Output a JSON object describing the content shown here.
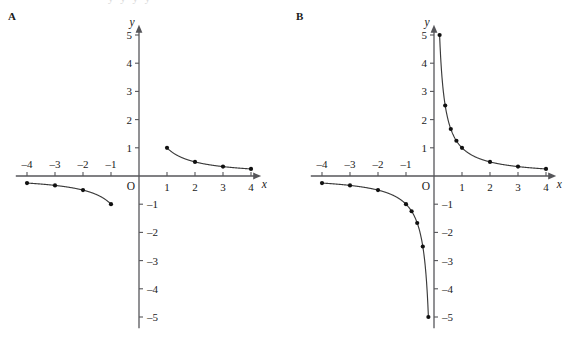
{
  "figure": {
    "cut_off_header_text": "y y y y",
    "panels": [
      {
        "key": "A",
        "label": "A",
        "name": "panel-a",
        "origin_label": "O",
        "x_axis_label": "x",
        "y_axis_label": "y",
        "x_ticks": [
          -4,
          -3,
          -2,
          -1,
          1,
          2,
          3,
          4
        ],
        "x_tick_labels": [
          "–4",
          "–3",
          "–2",
          "–1",
          "1",
          "2",
          "3",
          "4"
        ],
        "y_ticks": [
          5,
          4,
          3,
          2,
          1,
          -1,
          -2,
          -3,
          -4,
          -5
        ],
        "y_tick_labels": [
          "5",
          "4",
          "3",
          "2",
          "1",
          "–1",
          "–2",
          "–3",
          "–4",
          "–5"
        ],
        "xlim": [
          -4.4,
          4.4
        ],
        "ylim": [
          -5.4,
          5.4
        ],
        "points": [
          {
            "x": 1,
            "y": 1
          },
          {
            "x": 2,
            "y": 0.5
          },
          {
            "x": 3,
            "y": 0.3333
          },
          {
            "x": 4,
            "y": 0.25
          },
          {
            "x": -1,
            "y": -1
          },
          {
            "x": -2,
            "y": -0.5
          },
          {
            "x": -3,
            "y": -0.3333
          },
          {
            "x": -4,
            "y": -0.25
          }
        ],
        "curves": [
          {
            "branch": "positive",
            "x_from": 1,
            "x_to": 4
          },
          {
            "branch": "negative",
            "x_from": -4,
            "x_to": -1
          }
        ]
      },
      {
        "key": "B",
        "label": "B",
        "name": "panel-b",
        "origin_label": "O",
        "x_axis_label": "x",
        "y_axis_label": "y",
        "x_ticks": [
          -4,
          -3,
          -2,
          -1,
          1,
          2,
          3,
          4
        ],
        "x_tick_labels": [
          "–4",
          "–3",
          "–2",
          "–1",
          "1",
          "2",
          "3",
          "4"
        ],
        "y_ticks": [
          5,
          4,
          3,
          2,
          1,
          -1,
          -2,
          -3,
          -4,
          -5
        ],
        "y_tick_labels": [
          "5",
          "4",
          "3",
          "2",
          "1",
          "–1",
          "–2",
          "–3",
          "–4",
          "–5"
        ],
        "xlim": [
          -4.4,
          4.4
        ],
        "ylim": [
          -5.4,
          5.4
        ],
        "points": [
          {
            "x": 0.2,
            "y": 5
          },
          {
            "x": 0.4,
            "y": 2.5
          },
          {
            "x": 0.6,
            "y": 1.6667
          },
          {
            "x": 0.8,
            "y": 1.25
          },
          {
            "x": 1,
            "y": 1
          },
          {
            "x": 2,
            "y": 0.5
          },
          {
            "x": 3,
            "y": 0.3333
          },
          {
            "x": 4,
            "y": 0.25
          },
          {
            "x": -0.2,
            "y": -5
          },
          {
            "x": -0.4,
            "y": -2.5
          },
          {
            "x": -0.6,
            "y": -1.6667
          },
          {
            "x": -0.8,
            "y": -1.25
          },
          {
            "x": -1,
            "y": -1
          },
          {
            "x": -2,
            "y": -0.5
          },
          {
            "x": -3,
            "y": -0.3333
          },
          {
            "x": -4,
            "y": -0.25
          }
        ],
        "curves": [
          {
            "branch": "positive",
            "x_from": 0.2,
            "x_to": 4
          },
          {
            "branch": "negative",
            "x_from": -4,
            "x_to": -0.2
          }
        ]
      }
    ]
  },
  "chart_data": {
    "type": "line",
    "title": "",
    "xlabel": "x",
    "ylabel": "y",
    "xlim": [
      -4.4,
      4.4
    ],
    "ylim": [
      -5.4,
      5.4
    ],
    "grid": false,
    "legend": "none",
    "function": "y = 1/x",
    "series": [
      {
        "name": "A: y = 1/x (integer sample points)",
        "x": [
          -4,
          -3,
          -2,
          -1,
          1,
          2,
          3,
          4
        ],
        "values": [
          -0.25,
          -0.3333,
          -0.5,
          -1,
          1,
          0.5,
          0.3333,
          0.25
        ]
      },
      {
        "name": "B: y = 1/x (refined sample points)",
        "x": [
          -4,
          -3,
          -2,
          -1,
          -0.8,
          -0.6,
          -0.4,
          -0.2,
          0.2,
          0.4,
          0.6,
          0.8,
          1,
          2,
          3,
          4
        ],
        "values": [
          -0.25,
          -0.3333,
          -0.5,
          -1,
          -1.25,
          -1.6667,
          -2.5,
          -5,
          5,
          2.5,
          1.6667,
          1.25,
          1,
          0.5,
          0.3333,
          0.25
        ]
      }
    ]
  },
  "style": {
    "axis_color": "#56565a",
    "curve_color": "#3a3a3a",
    "point_color": "#111111",
    "text_color": "#1a1a1a",
    "background": "#ffffff"
  }
}
